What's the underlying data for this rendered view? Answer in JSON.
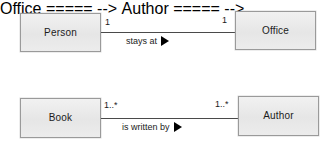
{
  "diagram": {
    "type": "uml-class-association-diagram",
    "background_color": "#ffffff",
    "box_fill_color": "#eaeaea",
    "box_border_color": "#9a9a9a",
    "line_color": "#4a4a4a",
    "text_color": "#1b1b1b",
    "arrow_color": "#000000"
  },
  "classes": {
    "person": {
      "name": "Person"
    },
    "office": {
      "name": "Office"
    },
    "book": {
      "name": "Book"
    },
    "author": {
      "name": "Author"
    }
  },
  "relationships": [
    {
      "id": "person-stays-at-office",
      "source": "Person",
      "target": "Office",
      "label": "stays at",
      "arrow": "solid-right-triangle",
      "source_multiplicity": "1",
      "target_multiplicity": "1"
    },
    {
      "id": "book-is-written-by-author",
      "source": "Book",
      "target": "Author",
      "label": "is written by",
      "arrow": "solid-right-triangle",
      "source_multiplicity": "1..*",
      "target_multiplicity": "1..*"
    }
  ]
}
